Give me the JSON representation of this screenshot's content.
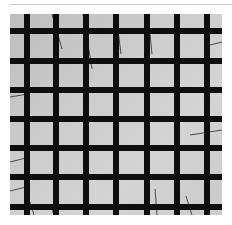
{
  "image": {
    "subject": "black grid lattice over light gray background with thin diagonal wires",
    "colors": {
      "background": "#ffffff",
      "panel": "#cdcdcd",
      "grid": "#0e0e0e",
      "wire": "#2a2a2a",
      "rule": "#c8c8c8"
    },
    "grid": {
      "vertical_bars_x": [
        14,
        43,
        73,
        103,
        134,
        164,
        194
      ],
      "horizontal_bars_y": [
        14,
        44,
        73,
        102,
        131,
        160,
        190
      ],
      "bar_thickness": 6
    },
    "wires": [
      {
        "x1": 42,
        "y1": 0,
        "x2": 52,
        "y2": 35
      },
      {
        "x1": 73,
        "y1": 0,
        "x2": 82,
        "y2": 55
      },
      {
        "x1": 106,
        "y1": 0,
        "x2": 111,
        "y2": 40
      },
      {
        "x1": 138,
        "y1": 0,
        "x2": 142,
        "y2": 40
      },
      {
        "x1": 0,
        "y1": 83,
        "x2": 18,
        "y2": 80
      },
      {
        "x1": 0,
        "y1": 148,
        "x2": 20,
        "y2": 143
      },
      {
        "x1": 0,
        "y1": 177,
        "x2": 20,
        "y2": 172
      },
      {
        "x1": 180,
        "y1": 121,
        "x2": 212,
        "y2": 116
      },
      {
        "x1": 212,
        "y1": 28,
        "x2": 196,
        "y2": 32
      },
      {
        "x1": 145,
        "y1": 175,
        "x2": 147,
        "y2": 201
      },
      {
        "x1": 176,
        "y1": 182,
        "x2": 182,
        "y2": 201
      },
      {
        "x1": 20,
        "y1": 188,
        "x2": 24,
        "y2": 201
      },
      {
        "x1": 40,
        "y1": 190,
        "x2": 44,
        "y2": 201
      }
    ]
  }
}
